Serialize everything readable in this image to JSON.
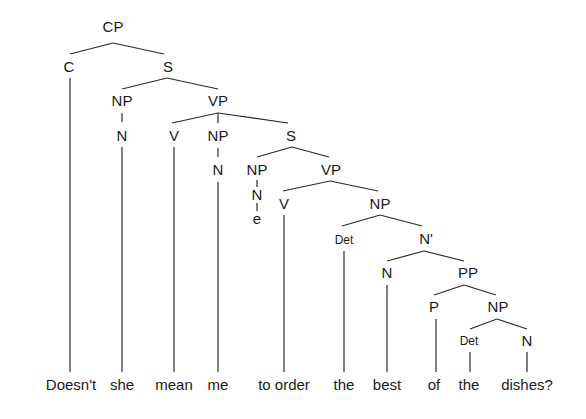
{
  "diagram": {
    "type": "syntax-tree",
    "sentence": "Doesn't she mean me to order the best of the dishes?",
    "nodes": [
      {
        "id": "cp",
        "label": "CP",
        "x": 113,
        "y": 32
      },
      {
        "id": "c",
        "label": "C",
        "x": 69,
        "y": 72
      },
      {
        "id": "s1",
        "label": "S",
        "x": 168,
        "y": 72
      },
      {
        "id": "np1",
        "label": "NP",
        "x": 122,
        "y": 106
      },
      {
        "id": "vp1",
        "label": "VP",
        "x": 218,
        "y": 106
      },
      {
        "id": "n1",
        "label": "N",
        "x": 122,
        "y": 141
      },
      {
        "id": "v1",
        "label": "V",
        "x": 174,
        "y": 141
      },
      {
        "id": "np2",
        "label": "NP",
        "x": 218,
        "y": 141
      },
      {
        "id": "s2",
        "label": "S",
        "x": 291,
        "y": 141
      },
      {
        "id": "n2",
        "label": "N",
        "x": 218,
        "y": 175
      },
      {
        "id": "np3",
        "label": "NP",
        "x": 257,
        "y": 175
      },
      {
        "id": "vp2",
        "label": "VP",
        "x": 331,
        "y": 175
      },
      {
        "id": "n3",
        "label": "N",
        "x": 257,
        "y": 199
      },
      {
        "id": "e",
        "label": "e",
        "x": 257,
        "y": 224
      },
      {
        "id": "v2",
        "label": "V",
        "x": 284,
        "y": 209
      },
      {
        "id": "np4",
        "label": "NP",
        "x": 380,
        "y": 209
      },
      {
        "id": "det1",
        "label": "Det",
        "x": 344,
        "y": 243,
        "small": true
      },
      {
        "id": "nbar",
        "label": "N'",
        "x": 426,
        "y": 244
      },
      {
        "id": "n4",
        "label": "N",
        "x": 387,
        "y": 278
      },
      {
        "id": "pp",
        "label": "PP",
        "x": 468,
        "y": 278
      },
      {
        "id": "p",
        "label": "P",
        "x": 434,
        "y": 312
      },
      {
        "id": "np5",
        "label": "NP",
        "x": 498,
        "y": 312
      },
      {
        "id": "det2",
        "label": "Det",
        "x": 468,
        "y": 344,
        "small": true
      },
      {
        "id": "n5",
        "label": "N",
        "x": 527,
        "y": 346
      }
    ],
    "words": [
      {
        "text": "Doesn't",
        "x": 71
      },
      {
        "text": "she",
        "x": 122
      },
      {
        "text": "mean",
        "x": 174
      },
      {
        "text": "me",
        "x": 218
      },
      {
        "text": "to order",
        "x": 284
      },
      {
        "text": "the",
        "x": 344
      },
      {
        "text": "best",
        "x": 387
      },
      {
        "text": "of",
        "x": 434
      },
      {
        "text": "the",
        "x": 468
      },
      {
        "text": "dishes?",
        "x": 527
      }
    ],
    "word_baseline_y": 390
  }
}
